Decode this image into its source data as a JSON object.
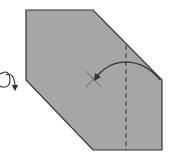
{
  "diagram": {
    "type": "origami-fold-step",
    "colors": {
      "paper_fill": "#a6a6a6",
      "outline": "#333333",
      "background": "#ffffff"
    },
    "elements": [
      {
        "name": "paper-shape",
        "kind": "hexagon"
      },
      {
        "name": "valley-fold-line",
        "kind": "dashed-line"
      },
      {
        "name": "fold-arrow",
        "kind": "curved-arrow"
      },
      {
        "name": "target-x-mark",
        "kind": "x-mark"
      },
      {
        "name": "turn-over-symbol",
        "kind": "loop-arrow"
      }
    ]
  }
}
